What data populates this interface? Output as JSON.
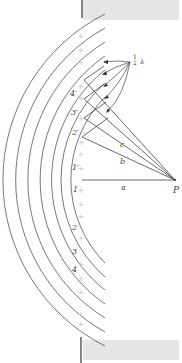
{
  "figure": {
    "point_label": "P",
    "distance_labels": {
      "a": "a",
      "b": "b",
      "c": "c"
    },
    "half_wavelength_label": {
      "num": "1",
      "den": "2",
      "sym": "λ"
    },
    "zone_labels_upper": [
      "1′",
      "2′",
      "3′",
      "4′"
    ],
    "zone_labels_lower": [
      "1",
      "2",
      "3",
      "4"
    ],
    "colors": {
      "line": "#555555",
      "wall": "#e6e6e6",
      "wall_edge": "#333333",
      "plus": "#c8c8c8"
    }
  }
}
